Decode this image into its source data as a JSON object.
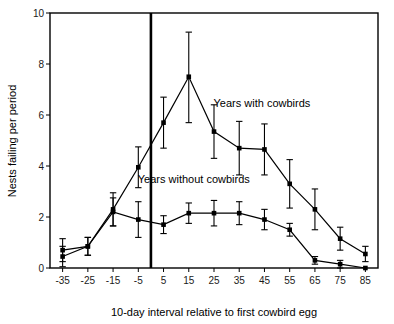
{
  "chart_data": {
    "type": "line",
    "title": "",
    "xlabel": "10-day interval relative to first cowbird egg",
    "ylabel": "Nests failing per period",
    "x": [
      -35,
      -25,
      -15,
      -5,
      5,
      15,
      25,
      35,
      45,
      55,
      65,
      75,
      85
    ],
    "xticklabels": [
      "-35",
      "-25",
      "-15",
      "-5",
      "5",
      "15",
      "25",
      "35",
      "45",
      "55",
      "65",
      "75",
      "85"
    ],
    "yticklabels": [
      "0",
      "2",
      "4",
      "6",
      "8",
      "10"
    ],
    "yticks": [
      0,
      2,
      4,
      6,
      8,
      10
    ],
    "xlim": [
      -40,
      90
    ],
    "ylim": [
      0,
      10
    ],
    "grid": false,
    "legend_position": "inline-annotation",
    "marker": "square",
    "errorbars": true,
    "series": [
      {
        "name": "Years with cowbirds",
        "values": [
          0.7,
          0.85,
          2.3,
          3.95,
          5.7,
          7.5,
          5.35,
          4.7,
          4.65,
          3.3,
          2.3,
          1.15,
          0.55
        ],
        "err_low": [
          0.45,
          0.35,
          0.65,
          0.8,
          1.0,
          1.8,
          1.05,
          1.05,
          1.0,
          0.95,
          0.8,
          0.45,
          0.3
        ],
        "err_high": [
          0.45,
          0.35,
          0.65,
          0.8,
          1.0,
          1.75,
          1.05,
          1.05,
          1.0,
          0.95,
          0.8,
          0.45,
          0.3
        ],
        "annotation": "Years with cowbirds",
        "annotation_x": 44,
        "annotation_y": 6.3
      },
      {
        "name": "Years without cowbirds",
        "values": [
          0.45,
          0.85,
          2.2,
          1.9,
          1.7,
          2.15,
          2.15,
          2.15,
          1.9,
          1.5,
          0.3,
          0.15,
          0.0
        ],
        "err_low": [
          0.4,
          0.35,
          0.55,
          0.7,
          0.35,
          0.4,
          0.5,
          0.45,
          0.4,
          0.25,
          0.15,
          0.15,
          0.0
        ],
        "err_high": [
          0.4,
          0.35,
          0.55,
          0.7,
          0.35,
          0.4,
          0.5,
          0.45,
          0.4,
          0.25,
          0.15,
          0.15,
          0.0
        ],
        "annotation": "Years without cowbirds",
        "annotation_x": 17,
        "annotation_y": 3.35
      }
    ],
    "reference_line": {
      "name": "first-cowbird-egg-marker",
      "x": 0,
      "orientation": "vertical"
    }
  }
}
